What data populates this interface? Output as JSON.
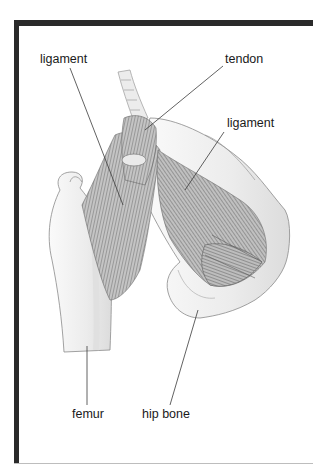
{
  "diagram": {
    "labels": [
      {
        "id": "ligament-left",
        "text": "ligament",
        "x": 40,
        "y": 52
      },
      {
        "id": "tendon",
        "text": "tendon",
        "x": 225,
        "y": 52
      },
      {
        "id": "ligament-right",
        "text": "ligament",
        "x": 227,
        "y": 116
      },
      {
        "id": "femur",
        "text": "femur",
        "x": 72,
        "y": 407
      },
      {
        "id": "hip-bone",
        "text": "hip bone",
        "x": 142,
        "y": 407
      }
    ],
    "colors": {
      "frame": "#2a2a2a",
      "text": "#1a1a1a",
      "leader": "#3a3a3a",
      "bone": "#f2f2f2",
      "bone_outline": "#8a8a8a",
      "muscle": "#b8b8b8",
      "fiber": "#6e6e6e"
    }
  }
}
